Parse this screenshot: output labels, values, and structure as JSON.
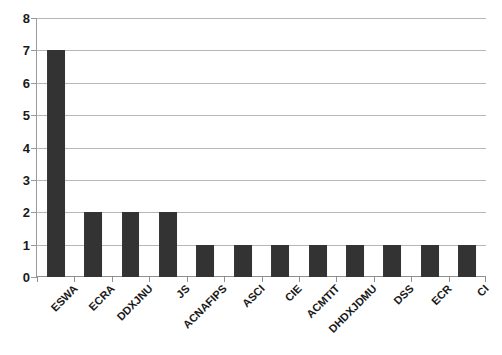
{
  "chart_data": {
    "type": "bar",
    "title": "",
    "subtitle": "",
    "xlabel": "",
    "ylabel": "",
    "categories": [
      "ESWA",
      "ECRA",
      "DDXJNU",
      "JS",
      "ACNAFIPS",
      "ASCI",
      "CIE",
      "ACMTIT",
      "DHDXJDMU",
      "DSS",
      "ECR",
      "CI"
    ],
    "values": [
      7,
      2,
      2,
      2,
      1,
      1,
      1,
      1,
      1,
      1,
      1,
      1
    ],
    "ylim": [
      0,
      8
    ],
    "y_ticks": [
      0,
      1,
      2,
      3,
      4,
      5,
      6,
      7,
      8
    ],
    "y_tick_labels": [
      "0",
      "1",
      "2",
      "3",
      "4",
      "5",
      "6",
      "7",
      "8"
    ],
    "grid": true,
    "grid_axis": "y",
    "legend": false,
    "legend_position": "none",
    "bar_color": "#333333",
    "gridline_color": "#b7b7b7",
    "axis_color": "#8f8f8f",
    "text_color": "#1a1a1a",
    "background_color": "#ffffff",
    "x_label_rotation": -45,
    "annotations": []
  }
}
